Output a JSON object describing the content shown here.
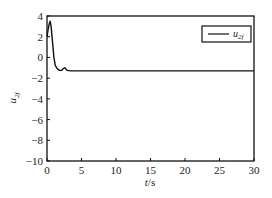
{
  "chart_data": {
    "type": "line",
    "title": "",
    "xlabel": "t/s",
    "ylabel": "u_{2f}",
    "xlim": [
      0,
      30
    ],
    "ylim": [
      -10,
      4
    ],
    "xticks": [
      0,
      5,
      10,
      15,
      20,
      25,
      30
    ],
    "yticks": [
      4,
      2,
      0,
      -2,
      -4,
      -6,
      -8,
      -10
    ],
    "xtick_labels": [
      "0",
      "5",
      "10",
      "15",
      "20",
      "25",
      "30"
    ],
    "ytick_labels": [
      "4",
      "2",
      "0",
      "−2",
      "−4",
      "−6",
      "−8",
      "−10"
    ],
    "grid": false,
    "legend_position": "upper right",
    "series": [
      {
        "name": "u_{2f}",
        "color": "#111111",
        "x": [
          0,
          0.15,
          0.3,
          0.45,
          0.6,
          0.8,
          1.0,
          1.2,
          1.5,
          1.8,
          2.1,
          2.4,
          2.6,
          2.9,
          3.5,
          5,
          10,
          15,
          20,
          25,
          30
        ],
        "y": [
          2.0,
          2.6,
          3.2,
          3.5,
          3.0,
          1.5,
          0.0,
          -0.8,
          -1.1,
          -1.25,
          -1.25,
          -1.05,
          -1.0,
          -1.25,
          -1.3,
          -1.3,
          -1.3,
          -1.3,
          -1.3,
          -1.3,
          -1.3
        ]
      }
    ]
  },
  "legend": {
    "label_main": "u",
    "label_sub": "2f"
  },
  "axes": {
    "xlabel_main": "t",
    "xlabel_rest": "/s",
    "ylabel_main": "u",
    "ylabel_sub": "2f"
  }
}
